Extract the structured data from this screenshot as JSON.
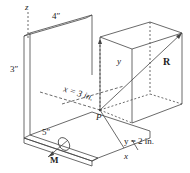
{
  "diagram": {
    "type": "3D isometric statics figure",
    "labels": {
      "z_axis": "z",
      "y_axis": "y",
      "x_axis": "x",
      "dim_width": "4″",
      "dim_height": "3″",
      "dim_depth": "5″",
      "x_coord": "x = 3 in.",
      "y_coord": "y = 2 in.",
      "point": "P",
      "resultant": "R",
      "moment": "M"
    },
    "colors": {
      "line": "#444444",
      "text": "#222222",
      "background": "#ffffff"
    }
  }
}
